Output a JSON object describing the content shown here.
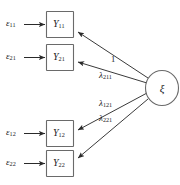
{
  "diagram": {
    "type": "path-diagram",
    "background_color": "#ffffff",
    "line_color": "#3a3a3a",
    "shape_stroke_color": "#6a6a6a",
    "errors": [
      {
        "id": "e11",
        "label": "ε",
        "subscript": "11"
      },
      {
        "id": "e21",
        "label": "ε",
        "subscript": "21"
      },
      {
        "id": "e12",
        "label": "ε",
        "subscript": "12"
      },
      {
        "id": "e22",
        "label": "ε",
        "subscript": "22"
      }
    ],
    "indicators": [
      {
        "id": "y11",
        "label": "Y",
        "subscript": "11"
      },
      {
        "id": "y21",
        "label": "Y",
        "subscript": "21"
      },
      {
        "id": "y12",
        "label": "Y",
        "subscript": "12"
      },
      {
        "id": "y22",
        "label": "Y",
        "subscript": "22"
      }
    ],
    "latent": {
      "id": "xi",
      "label": "ξ"
    },
    "loadings": [
      {
        "id": "load-1",
        "label": "1",
        "subscript": ""
      },
      {
        "id": "load-lambda211",
        "label": "λ",
        "subscript": "211"
      },
      {
        "id": "load-lambda121",
        "label": "λ",
        "subscript": "121"
      },
      {
        "id": "load-lambda221",
        "label": "λ",
        "subscript": "221"
      }
    ]
  }
}
